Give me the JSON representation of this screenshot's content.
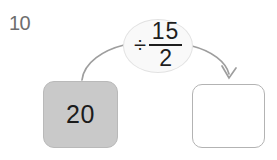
{
  "problem": {
    "number": "10"
  },
  "machine": {
    "input_box": {
      "value": "20",
      "fill_color": "#c9c9c9",
      "border_color": "#b9b9b9"
    },
    "operation": {
      "operator_symbol": "÷",
      "fraction_numerator": "15",
      "fraction_denominator": "2",
      "bubble_fill_color": "#f9f9f9",
      "bubble_border_color": "#e2e2e2"
    },
    "output_box": {
      "value": "",
      "fill_color": "#ffffff",
      "border_color": "#b3b3b3"
    },
    "arrows": {
      "incoming_arrow_name": "arrow-input-to-operation",
      "outgoing_arrow_name": "arrow-operation-to-output",
      "stroke_color": "#9e9e9e"
    }
  },
  "page": {
    "background_color": "#ffffff",
    "text_color": "#1e1e1e",
    "number_color": "#6e6e6e"
  }
}
